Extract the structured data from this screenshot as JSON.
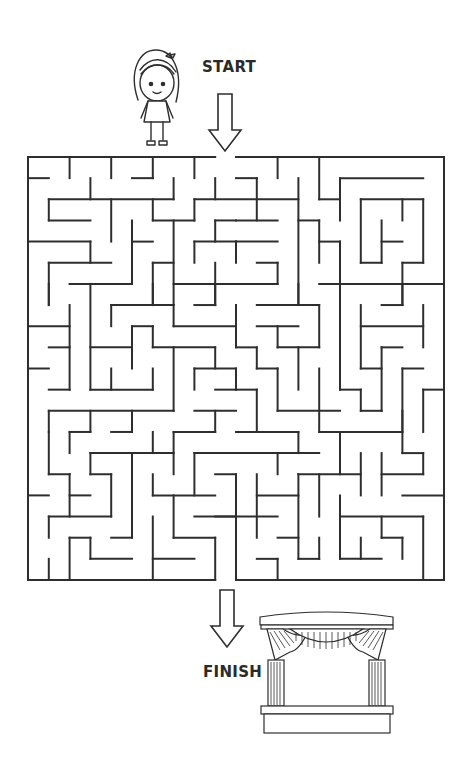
{
  "labels": {
    "start": "START",
    "finish": "FINISH"
  },
  "colors": {
    "line": "#2e2e2e",
    "background": "#ffffff"
  },
  "icons": {
    "character": "girl-character-icon",
    "start_arrow": "arrow-down-icon",
    "finish_arrow": "arrow-down-icon",
    "goal": "theater-stage-icon"
  },
  "maze": {
    "cols": 20,
    "rows": 20,
    "origin": [
      28,
      157
    ],
    "cell": [
      20.8,
      21.15
    ],
    "entrance": {
      "side": "top",
      "from_col": 9,
      "to_col": 10
    },
    "exit": {
      "side": "bottom",
      "from_col": 9,
      "to_col": 10
    },
    "walls": [
      [
        0,
        0,
        9,
        0
      ],
      [
        10,
        0,
        20,
        0
      ],
      [
        0,
        0,
        0,
        20
      ],
      [
        20,
        0,
        20,
        20
      ],
      [
        0,
        20,
        9,
        20
      ],
      [
        10,
        20,
        20,
        20
      ],
      [
        2,
        0,
        2,
        1
      ],
      [
        4,
        0,
        4,
        1
      ],
      [
        6,
        0,
        6,
        1
      ],
      [
        5,
        1,
        6,
        1
      ],
      [
        8,
        0,
        8,
        1
      ],
      [
        0,
        1,
        1,
        1
      ],
      [
        3,
        1,
        3,
        2
      ],
      [
        7,
        1,
        7,
        2
      ],
      [
        9,
        1,
        9,
        2
      ],
      [
        1,
        2,
        7,
        2
      ],
      [
        8,
        2,
        13,
        2
      ],
      [
        1,
        2,
        1,
        3
      ],
      [
        1,
        3,
        3,
        3
      ],
      [
        4,
        2,
        4,
        4
      ],
      [
        6,
        2,
        6,
        3
      ],
      [
        6,
        3,
        8,
        3
      ],
      [
        8,
        2,
        8,
        3
      ],
      [
        5,
        3,
        5,
        6
      ],
      [
        5,
        4,
        6,
        4
      ],
      [
        7,
        3,
        7,
        7
      ],
      [
        9,
        3,
        9,
        4
      ],
      [
        9,
        3,
        10,
        3
      ],
      [
        0,
        4,
        3,
        4
      ],
      [
        3,
        4,
        3,
        5
      ],
      [
        8,
        4,
        10,
        4
      ],
      [
        8,
        4,
        8,
        5
      ],
      [
        1,
        5,
        4,
        5
      ],
      [
        1,
        5,
        1,
        7
      ],
      [
        6,
        5,
        7,
        5
      ],
      [
        6,
        5,
        6,
        7
      ],
      [
        9,
        5,
        9,
        7
      ],
      [
        2,
        6,
        5,
        6
      ],
      [
        3,
        6,
        3,
        11
      ],
      [
        7,
        6,
        12,
        6
      ],
      [
        12,
        0,
        12,
        1
      ],
      [
        14,
        0,
        14,
        2
      ],
      [
        14,
        2,
        15,
        2
      ],
      [
        10,
        1,
        11,
        1
      ],
      [
        11,
        1,
        11,
        3
      ],
      [
        15,
        1,
        19,
        1
      ],
      [
        15,
        1,
        15,
        3
      ],
      [
        13,
        1,
        13,
        7
      ],
      [
        10,
        3,
        12,
        3
      ],
      [
        13,
        3,
        14,
        3
      ],
      [
        14,
        3,
        14,
        5
      ],
      [
        14,
        4,
        15,
        4
      ],
      [
        15,
        4,
        15,
        7
      ],
      [
        16,
        2,
        19,
        2
      ],
      [
        16,
        2,
        16,
        5
      ],
      [
        16,
        5,
        17,
        5
      ],
      [
        17,
        3,
        17,
        5
      ],
      [
        17,
        4,
        18,
        4
      ],
      [
        18,
        2,
        18,
        3
      ],
      [
        19,
        2,
        19,
        5
      ],
      [
        18,
        5,
        19,
        5
      ],
      [
        18,
        5,
        18,
        7
      ],
      [
        10,
        4,
        12,
        4
      ],
      [
        10,
        4,
        10,
        5
      ],
      [
        11,
        5,
        12,
        5
      ],
      [
        12,
        5,
        12,
        6
      ],
      [
        14,
        6,
        20,
        6
      ],
      [
        1,
        6,
        1,
        7
      ],
      [
        6,
        6,
        6,
        7
      ],
      [
        4,
        7,
        7,
        7
      ],
      [
        4,
        7,
        4,
        8
      ],
      [
        7,
        7,
        7,
        8
      ],
      [
        7,
        8,
        10,
        8
      ],
      [
        9,
        6,
        9,
        7
      ],
      [
        8,
        7,
        9,
        7
      ],
      [
        2,
        7,
        2,
        11
      ],
      [
        0,
        8,
        2,
        8
      ],
      [
        5,
        8,
        6,
        8
      ],
      [
        5,
        8,
        5,
        10
      ],
      [
        6,
        8,
        6,
        9
      ],
      [
        6,
        9,
        9,
        9
      ],
      [
        9,
        9,
        9,
        10
      ],
      [
        1,
        9,
        2,
        9
      ],
      [
        3,
        9,
        5,
        9
      ],
      [
        7,
        9,
        7,
        12
      ],
      [
        0,
        10,
        1,
        10
      ],
      [
        8,
        10,
        10,
        10
      ],
      [
        8,
        10,
        8,
        11
      ],
      [
        4,
        10,
        4,
        11
      ],
      [
        6,
        10,
        6,
        11
      ],
      [
        3,
        11,
        6,
        11
      ],
      [
        1,
        11,
        2,
        11
      ],
      [
        9,
        11,
        10,
        11
      ],
      [
        1,
        12,
        7,
        12
      ],
      [
        1,
        12,
        1,
        13
      ],
      [
        3,
        12,
        3,
        13
      ],
      [
        5,
        12,
        5,
        13
      ],
      [
        8,
        12,
        10,
        12
      ],
      [
        9,
        12,
        9,
        13
      ],
      [
        13,
        6,
        13,
        7
      ],
      [
        15,
        6,
        15,
        11
      ],
      [
        15,
        11,
        16,
        11
      ],
      [
        16,
        11,
        16,
        12
      ],
      [
        16,
        12,
        17,
        12
      ],
      [
        18,
        6,
        18,
        7
      ],
      [
        17,
        7,
        18,
        7
      ],
      [
        11,
        7,
        14,
        7
      ],
      [
        14,
        7,
        14,
        9
      ],
      [
        12,
        9,
        14,
        9
      ],
      [
        10,
        7,
        10,
        9
      ],
      [
        10,
        9,
        11,
        9
      ],
      [
        11,
        9,
        11,
        10
      ],
      [
        11,
        10,
        12,
        10
      ],
      [
        12,
        10,
        12,
        12
      ],
      [
        12,
        12,
        15,
        12
      ],
      [
        11,
        8,
        13,
        8
      ],
      [
        12,
        8,
        12,
        9
      ],
      [
        13,
        9,
        13,
        11
      ],
      [
        14,
        10,
        14,
        13
      ],
      [
        16,
        7,
        16,
        10
      ],
      [
        16,
        8,
        19,
        8
      ],
      [
        19,
        7,
        19,
        9
      ],
      [
        16,
        10,
        17,
        10
      ],
      [
        17,
        9,
        17,
        12
      ],
      [
        17,
        9,
        18,
        9
      ],
      [
        18,
        10,
        19,
        10
      ],
      [
        18,
        10,
        18,
        13
      ],
      [
        19,
        11,
        20,
        11
      ],
      [
        19,
        11,
        19,
        13
      ],
      [
        10,
        10,
        10,
        11
      ],
      [
        10,
        11,
        11,
        11
      ],
      [
        11,
        11,
        11,
        13
      ],
      [
        1,
        13,
        1,
        15
      ],
      [
        1,
        15,
        2,
        15
      ],
      [
        2,
        15,
        2,
        17
      ],
      [
        2,
        13,
        3,
        13
      ],
      [
        2,
        13,
        2,
        14
      ],
      [
        4,
        13,
        5,
        13
      ],
      [
        6,
        13,
        6,
        14
      ],
      [
        7,
        13,
        9,
        13
      ],
      [
        7,
        13,
        7,
        15
      ],
      [
        3,
        14,
        7,
        14
      ],
      [
        3,
        14,
        3,
        15
      ],
      [
        3,
        15,
        4,
        15
      ],
      [
        4,
        15,
        4,
        17
      ],
      [
        5,
        14,
        5,
        18
      ],
      [
        4,
        18,
        5,
        18
      ],
      [
        8,
        14,
        10,
        14
      ],
      [
        8,
        14,
        8,
        16
      ],
      [
        6,
        15,
        6,
        16
      ],
      [
        6,
        16,
        9,
        16
      ],
      [
        7,
        16,
        7,
        18
      ],
      [
        7,
        18,
        9,
        18
      ],
      [
        9,
        18,
        9,
        20
      ],
      [
        9,
        15,
        10,
        15
      ],
      [
        0,
        16,
        1,
        16
      ],
      [
        2,
        16,
        3,
        16
      ],
      [
        1,
        17,
        4,
        17
      ],
      [
        1,
        17,
        1,
        18
      ],
      [
        8,
        17,
        10,
        17
      ],
      [
        6,
        17,
        6,
        20
      ],
      [
        2,
        18,
        3,
        18
      ],
      [
        2,
        18,
        2,
        20
      ],
      [
        3,
        18,
        3,
        19
      ],
      [
        3,
        19,
        5,
        19
      ],
      [
        6,
        19,
        8,
        19
      ],
      [
        1,
        19,
        1,
        20
      ],
      [
        10,
        13,
        13,
        13
      ],
      [
        13,
        13,
        13,
        14
      ],
      [
        14,
        13,
        18,
        13
      ],
      [
        18,
        12,
        18,
        14
      ],
      [
        18,
        14,
        19,
        14
      ],
      [
        19,
        14,
        19,
        15
      ],
      [
        10,
        14,
        14,
        14
      ],
      [
        12,
        14,
        12,
        15
      ],
      [
        15,
        13,
        15,
        15
      ],
      [
        13,
        15,
        16,
        15
      ],
      [
        16,
        14,
        16,
        16
      ],
      [
        17,
        14,
        17,
        16
      ],
      [
        17,
        15,
        19,
        15
      ],
      [
        13,
        15,
        13,
        19
      ],
      [
        13,
        19,
        14,
        19
      ],
      [
        14,
        18,
        14,
        19
      ],
      [
        14,
        15,
        14,
        17
      ],
      [
        10,
        15,
        10,
        20
      ],
      [
        11,
        15,
        11,
        18
      ],
      [
        11,
        16,
        13,
        16
      ],
      [
        15,
        16,
        15,
        19
      ],
      [
        15,
        19,
        17,
        19
      ],
      [
        16,
        18,
        16,
        19
      ],
      [
        18,
        16,
        20,
        16
      ],
      [
        9,
        17,
        12,
        17
      ],
      [
        15,
        17,
        19,
        17
      ],
      [
        19,
        17,
        19,
        20
      ],
      [
        17,
        17,
        17,
        18
      ],
      [
        17,
        18,
        18,
        18
      ],
      [
        18,
        18,
        18,
        19
      ],
      [
        12,
        18,
        13,
        18
      ],
      [
        11,
        19,
        12,
        19
      ],
      [
        12,
        19,
        12,
        20
      ]
    ]
  }
}
